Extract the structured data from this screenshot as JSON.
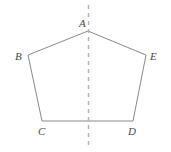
{
  "figure": {
    "kind": "geometry-diagram",
    "shape_name": "pentagon",
    "canvas": {
      "width": 171,
      "height": 152,
      "background": "#ffffff"
    },
    "colors": {
      "outline": "#8a8a8a",
      "symmetry_line": "#c9a8b0",
      "label_text": "#4a4a4a"
    },
    "vertices": [
      {
        "id": "A",
        "label": "A",
        "x": 88,
        "y": 31,
        "label_x": 79,
        "label_y": 18
      },
      {
        "id": "B",
        "label": "B",
        "x": 28,
        "y": 55,
        "label_x": 15,
        "label_y": 51
      },
      {
        "id": "C",
        "label": "C",
        "x": 42,
        "y": 121,
        "label_x": 38,
        "label_y": 126
      },
      {
        "id": "D",
        "label": "D",
        "x": 133,
        "y": 121,
        "label_x": 128,
        "label_y": 126
      },
      {
        "id": "E",
        "label": "E",
        "x": 146,
        "y": 55,
        "label_x": 150,
        "label_y": 51
      }
    ],
    "edges": [
      {
        "from": "A",
        "to": "B"
      },
      {
        "from": "B",
        "to": "C"
      },
      {
        "from": "C",
        "to": "D"
      },
      {
        "from": "D",
        "to": "E"
      },
      {
        "from": "E",
        "to": "A"
      }
    ],
    "symmetry_line": {
      "orientation": "vertical",
      "x": 88.5,
      "y_top": 5,
      "y_bottom": 148,
      "style": "dashed",
      "dash_pattern": "4 4",
      "stroke_width": 1.4
    },
    "outline_stroke_width": 1
  }
}
